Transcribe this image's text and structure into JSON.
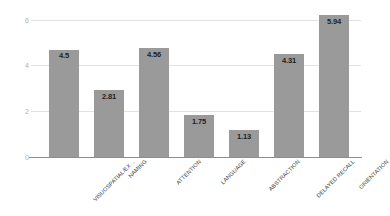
{
  "chart_data": {
    "type": "bar",
    "title": "",
    "subtitle": "",
    "xlabel": "",
    "ylabel": "",
    "categories": [
      "VISUOSPATIAL/EX…",
      "NAMING",
      "ATTENTION",
      "LANGUAGE",
      "ABSTRACTION",
      "DELAYED RECALL",
      "ORIENTATION"
    ],
    "values": [
      4.5,
      2.81,
      4.56,
      1.75,
      1.13,
      4.31,
      5.94
    ],
    "value_labels": [
      "4.5",
      "2.81",
      "4.56",
      "1.75",
      "1.13",
      "4.31",
      "5.94"
    ],
    "ylim": [
      0,
      6
    ],
    "yticks": [
      0,
      2,
      4,
      6
    ],
    "ytick_labels": [
      "0",
      "2",
      "4",
      "6"
    ],
    "grid": true,
    "legend": false,
    "legend_position": "none",
    "bar_color": "#9a9a9a",
    "gridline_color": "#e2e2e2",
    "axis_color": "#8d8d8d",
    "value_label_color": "#1f1f1f",
    "tick_label_color": "#b0b0b0",
    "category_label_color": "#3a3a3a",
    "background_color": "#ffffff"
  }
}
